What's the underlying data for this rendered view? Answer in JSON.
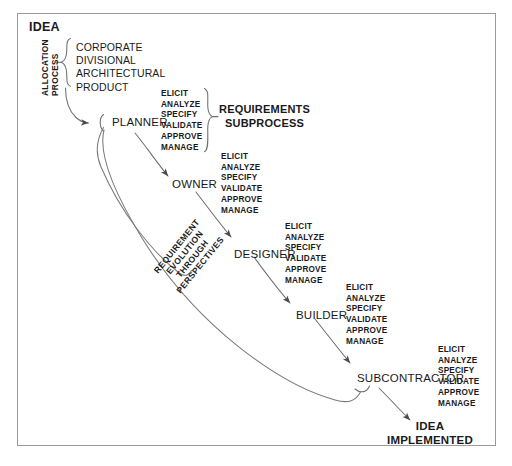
{
  "diagram": {
    "title_start": "IDEA",
    "title_end_line1": "IDEA",
    "title_end_line2": "IMPLEMENTED",
    "allocation_label_line1": "ALLOCATION",
    "allocation_label_line2": "PROCESS",
    "allocation_categories": [
      "CORPORATE",
      "DIVISIONAL",
      "ARCHITECTURAL",
      "PRODUCT"
    ],
    "subprocess_label_line1": "REQUIREMENTS",
    "subprocess_label_line2": "SUBPROCESS",
    "evolution_label": [
      "REQUIREMENT",
      "EVOLUTION",
      "THROUGH",
      "PERSPECTIVES"
    ],
    "steps": [
      "ELICIT",
      "ANALYZE",
      "SPECIFY",
      "VALIDATE",
      "APPROVE",
      "MANAGE"
    ],
    "roles": [
      {
        "name": "PLANNER"
      },
      {
        "name": "OWNER"
      },
      {
        "name": "DESIGNER"
      },
      {
        "name": "BUILDER"
      },
      {
        "name": "SUBCONTRACTOR"
      }
    ],
    "colors": {
      "ink": "#1a1a1a",
      "line": "#6e6e6e",
      "border": "#9a9a9a",
      "background": "#ffffff"
    }
  }
}
